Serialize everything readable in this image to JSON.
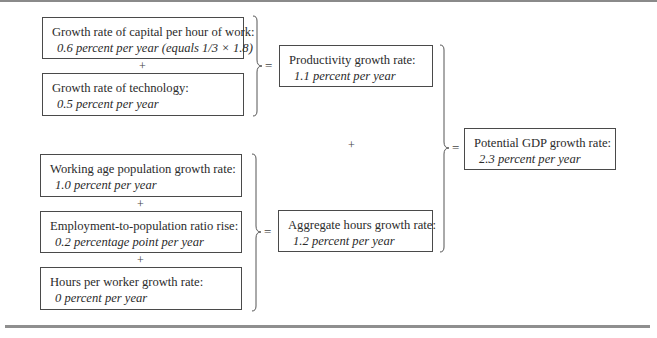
{
  "diagram": {
    "type": "flow-equation",
    "top_group": {
      "inputs": [
        {
          "title": "Growth rate of capital per hour of work:",
          "value": "0.6 percent per year (equals 1/3 × 1.8)"
        },
        {
          "title": "Growth rate of technology:",
          "value": "0.5 percent per year"
        }
      ],
      "joiner": "+",
      "equals": "=",
      "result": {
        "title": "Productivity growth rate:",
        "value": "1.1 percent per year"
      }
    },
    "bottom_group": {
      "inputs": [
        {
          "title": "Working age population growth rate:",
          "value": "1.0 percent per year"
        },
        {
          "title": "Employment-to-population ratio rise:",
          "value": "0.2 percentage point per year"
        },
        {
          "title": "Hours per worker growth rate:",
          "value": "0 percent per year"
        }
      ],
      "joiner": "+",
      "equals": "=",
      "result": {
        "title": "Aggregate hours growth rate:",
        "value": "1.2 percent per year"
      }
    },
    "middle_joiner": "+",
    "final_equals": "=",
    "final": {
      "title": "Potential GDP growth rate:",
      "value": "2.3 percent per year"
    }
  }
}
